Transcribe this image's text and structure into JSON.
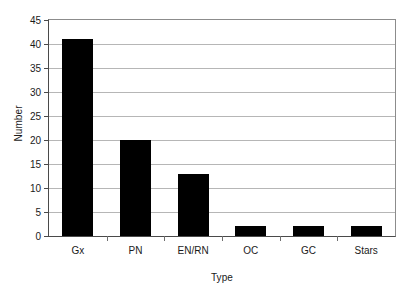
{
  "chart_data": {
    "type": "bar",
    "title": "",
    "subtitle": "",
    "xlabel": "Type",
    "ylabel": "Number",
    "categories": [
      "Gx",
      "PN",
      "EN/RN",
      "OC",
      "GC",
      "Stars"
    ],
    "values": [
      41,
      20,
      13,
      2,
      2,
      2
    ],
    "series": [
      {
        "name": "Number",
        "values": [
          41,
          20,
          13,
          2,
          2,
          2
        ]
      }
    ],
    "ylim": [
      0,
      45
    ],
    "ytick_step": 5,
    "yticks": [
      0,
      5,
      10,
      15,
      20,
      25,
      30,
      35,
      40,
      45
    ],
    "ytick_labels": [
      "0",
      "5",
      "10",
      "15",
      "20",
      "25",
      "30",
      "35",
      "40",
      "45"
    ],
    "grid": true,
    "grid_axis": "y",
    "legend": false,
    "legend_position": "none",
    "bar_color": "#000000",
    "grid_color": "#b6b6b6",
    "axis_color": "#4a4a4a",
    "background_color": "#ffffff",
    "annotations": []
  },
  "colors": {
    "bar": "#000000",
    "grid": "#b6b6b6",
    "axis": "#4a4a4a",
    "text": "#1a1a1a",
    "background": "#ffffff"
  }
}
